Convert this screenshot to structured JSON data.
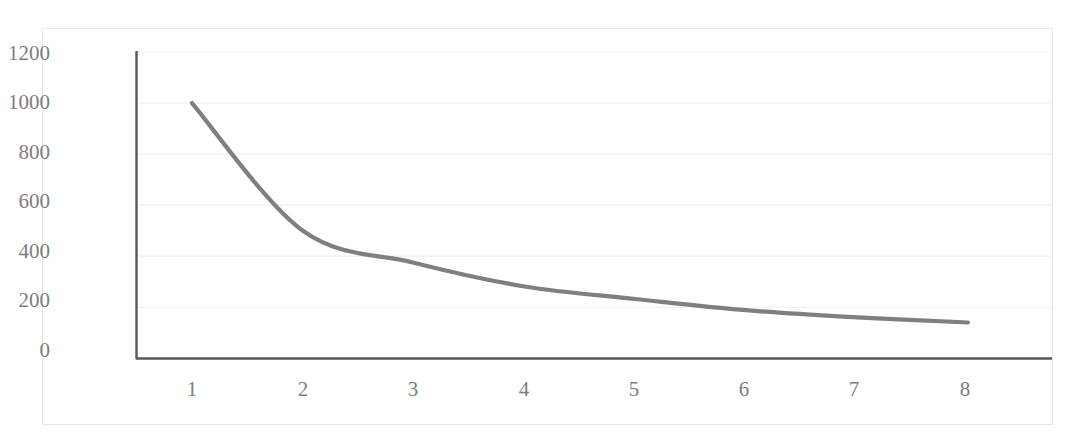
{
  "chart_data": {
    "type": "line",
    "title": "",
    "subtitle": "",
    "xlabel": "",
    "ylabel": "",
    "x": [
      1,
      2,
      3,
      4,
      5,
      6,
      7,
      8
    ],
    "series": [
      {
        "name": "series-1",
        "values": [
          1000,
          500,
          375,
          282,
          233,
          189,
          161,
          141
        ],
        "color": "#7f7f7f"
      }
    ],
    "xlim": [
      0.6,
      8.6
    ],
    "ylim": [
      0,
      1200
    ],
    "y_ticks": [
      "0",
      "200",
      "400",
      "600",
      "800",
      "1000",
      "1200"
    ],
    "y_tick_values": [
      0,
      200,
      400,
      600,
      800,
      1000,
      1200
    ],
    "x_ticks": [
      "1",
      "2",
      "3",
      "4",
      "5",
      "6",
      "7",
      "8"
    ],
    "x_tick_values": [
      1,
      2,
      3,
      4,
      5,
      6,
      7,
      8
    ],
    "grid": {
      "horizontal": true,
      "vertical": false,
      "color": "#f2f2f2"
    },
    "legend": {
      "visible": false,
      "position": "none",
      "entries": []
    },
    "axis_line_color": "#595959",
    "plot_background": "#ffffff",
    "border_color": "#e8e8ea",
    "annotations": []
  }
}
